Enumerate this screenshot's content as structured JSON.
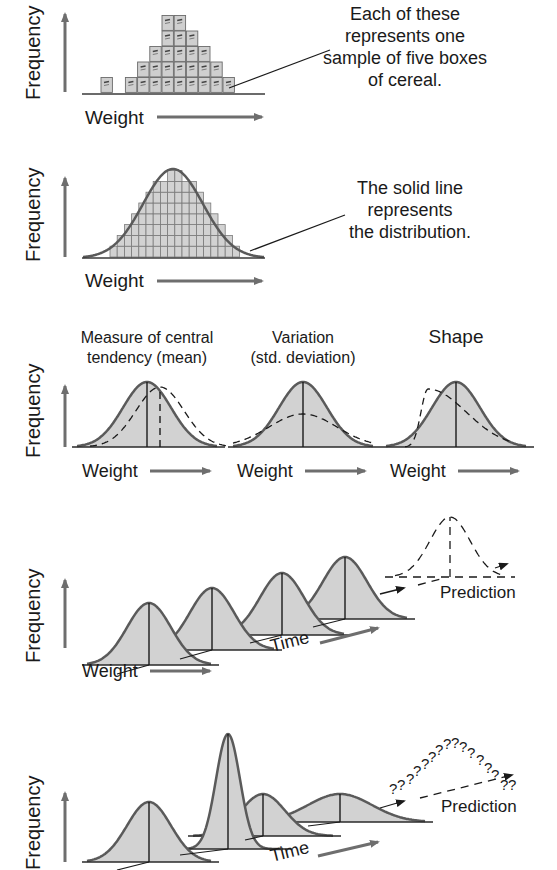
{
  "colors": {
    "fill": "#d2d2d2",
    "curve": "#5a5a5a",
    "axis_arrow": "#6e6e6e",
    "text": "#1a1a1a",
    "box_fill": "#cfcfcf"
  },
  "axis": {
    "y_label": "Frequency",
    "x_label": "Weight",
    "time_label": "Time"
  },
  "panel1": {
    "annotation": [
      "Each of these",
      "represents one",
      "sample of five boxes",
      "of cereal."
    ],
    "box_column_heights": [
      1,
      0,
      1,
      2,
      3,
      5,
      5,
      4,
      3,
      2,
      1
    ]
  },
  "panel2": {
    "annotation": [
      "The solid line",
      "represents",
      "the distribution."
    ]
  },
  "panel3": {
    "headers": [
      [
        "Measure of central",
        "tendency (mean)"
      ],
      [
        "Variation",
        "(std. deviation)"
      ],
      [
        "Shape"
      ]
    ]
  },
  "panel4": {
    "prediction_label": "Prediction"
  },
  "panel5": {
    "prediction_label": "Prediction",
    "question_marks": "??????????????"
  }
}
